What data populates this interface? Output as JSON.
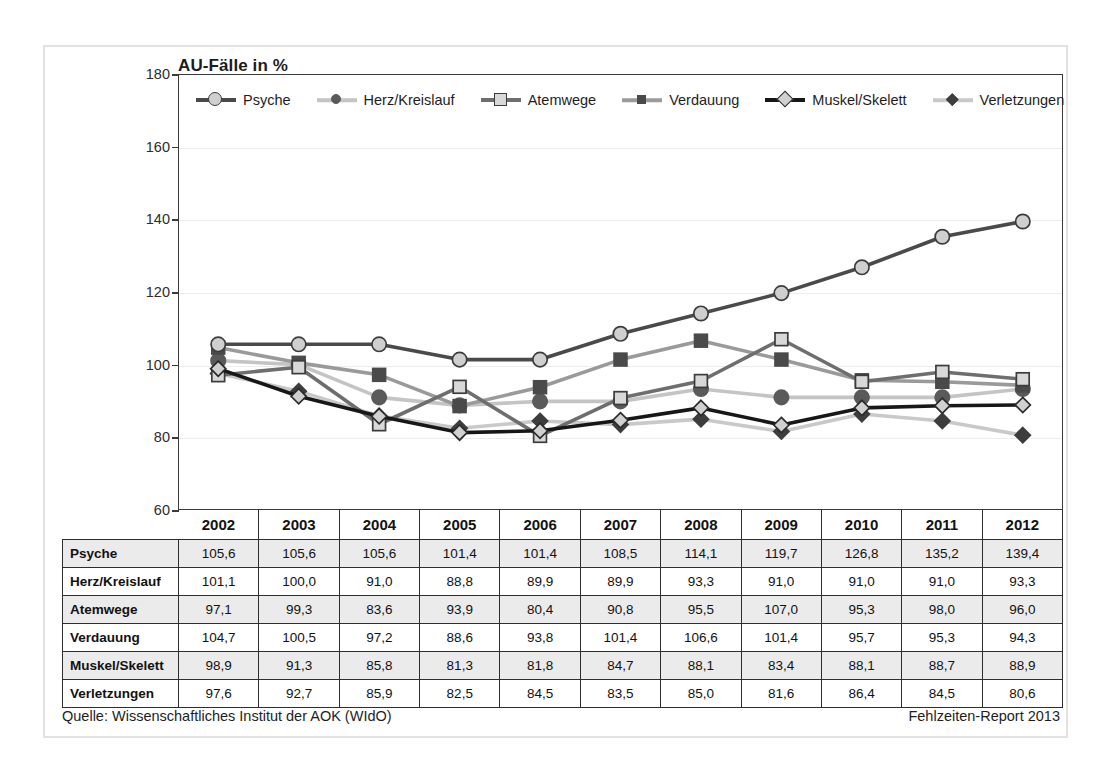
{
  "chart_title": "AU-Fälle in %",
  "footer": {
    "source": "Quelle: Wissenschaftliches Institut der AOK (WIdO)",
    "report": "Fehlzeiten-Report 2013"
  },
  "axis": {
    "y_ticks": [
      "180",
      "160",
      "140",
      "120",
      "100",
      "80",
      "60"
    ]
  },
  "table": {
    "corner_label": "",
    "columns": [
      "2002",
      "2003",
      "2004",
      "2005",
      "2006",
      "2007",
      "2008",
      "2009",
      "2010",
      "2011",
      "2012"
    ],
    "rows": [
      {
        "label": "Psyche",
        "values": [
          "105,6",
          "105,6",
          "105,6",
          "101,4",
          "101,4",
          "108,5",
          "114,1",
          "119,7",
          "126,8",
          "135,2",
          "139,4"
        ]
      },
      {
        "label": "Herz/Kreislauf",
        "values": [
          "101,1",
          "100,0",
          "91,0",
          "88,8",
          "89,9",
          "89,9",
          "93,3",
          "91,0",
          "91,0",
          "91,0",
          "93,3"
        ]
      },
      {
        "label": "Atemwege",
        "values": [
          "97,1",
          "99,3",
          "83,6",
          "93,9",
          "80,4",
          "90,8",
          "95,5",
          "107,0",
          "95,3",
          "98,0",
          "96,0"
        ]
      },
      {
        "label": "Verdauung",
        "values": [
          "104,7",
          "100,5",
          "97,2",
          "88,6",
          "93,8",
          "101,4",
          "106,6",
          "101,4",
          "95,7",
          "95,3",
          "94,3"
        ]
      },
      {
        "label": "Muskel/Skelett",
        "values": [
          "98,9",
          "91,3",
          "85,8",
          "81,3",
          "81,8",
          "84,7",
          "88,1",
          "83,4",
          "88,1",
          "88,7",
          "88,9"
        ]
      },
      {
        "label": "Verletzungen",
        "values": [
          "97,6",
          "92,7",
          "85,9",
          "82,5",
          "84,5",
          "83,5",
          "85,0",
          "81,6",
          "86,4",
          "84,5",
          "80,6"
        ]
      }
    ]
  },
  "legend": [
    {
      "label": "Psyche",
      "marker": "circle-large-light",
      "line_color": "#4a4a4a",
      "marker_fill": "#cfcfcf",
      "marker_stroke": "#3c3c3c"
    },
    {
      "label": "Herz/Kreislauf",
      "marker": "circle-dark",
      "line_color": "#c4c4c4",
      "marker_fill": "#5a5a5a",
      "marker_stroke": "#5a5a5a"
    },
    {
      "label": "Atemwege",
      "marker": "square-light",
      "line_color": "#6e6e6e",
      "marker_fill": "#d8d8d8",
      "marker_stroke": "#3c3c3c"
    },
    {
      "label": "Verdauung",
      "marker": "square-dark",
      "line_color": "#9a9a9a",
      "marker_fill": "#4a4a4a",
      "marker_stroke": "#4a4a4a"
    },
    {
      "label": "Muskel/Skelett",
      "marker": "diamond-light",
      "line_color": "#171717",
      "marker_fill": "#d0d0d0",
      "marker_stroke": "#2a2a2a"
    },
    {
      "label": "Verletzungen",
      "marker": "diamond-small-dark",
      "line_color": "#c9c9c9",
      "marker_fill": "#3d3d3d",
      "marker_stroke": "#3d3d3d"
    }
  ],
  "chart_data": {
    "type": "line",
    "title": "AU-Fälle in %",
    "xlabel": "",
    "ylabel": "AU-Fälle in %",
    "ylim": [
      60,
      180
    ],
    "ytick_step": 20,
    "grid": true,
    "legend_position": "top-inside",
    "x": [
      "2002",
      "2003",
      "2004",
      "2005",
      "2006",
      "2007",
      "2008",
      "2009",
      "2010",
      "2011",
      "2012"
    ],
    "series": [
      {
        "name": "Psyche",
        "color": "#4a4a4a",
        "marker": "circle",
        "values": [
          105.6,
          105.6,
          105.6,
          101.4,
          101.4,
          108.5,
          114.1,
          119.7,
          126.8,
          135.2,
          139.4
        ]
      },
      {
        "name": "Herz/Kreislauf",
        "color": "#c4c4c4",
        "marker": "circle",
        "values": [
          101.1,
          100.0,
          91.0,
          88.8,
          89.9,
          89.9,
          93.3,
          91.0,
          91.0,
          91.0,
          93.3
        ]
      },
      {
        "name": "Atemwege",
        "color": "#6e6e6e",
        "marker": "square",
        "values": [
          97.1,
          99.3,
          83.6,
          93.9,
          80.4,
          90.8,
          95.5,
          107.0,
          95.3,
          98.0,
          96.0
        ]
      },
      {
        "name": "Verdauung",
        "color": "#9a9a9a",
        "marker": "square",
        "values": [
          104.7,
          100.5,
          97.2,
          88.6,
          93.8,
          101.4,
          106.6,
          101.4,
          95.7,
          95.3,
          94.3
        ]
      },
      {
        "name": "Muskel/Skelett",
        "color": "#171717",
        "marker": "diamond",
        "values": [
          98.9,
          91.3,
          85.8,
          81.3,
          81.8,
          84.7,
          88.1,
          83.4,
          88.1,
          88.7,
          88.9
        ]
      },
      {
        "name": "Verletzungen",
        "color": "#c9c9c9",
        "marker": "diamond",
        "values": [
          97.6,
          92.7,
          85.9,
          82.5,
          84.5,
          83.5,
          85.0,
          81.6,
          86.4,
          84.5,
          80.6
        ]
      }
    ]
  }
}
